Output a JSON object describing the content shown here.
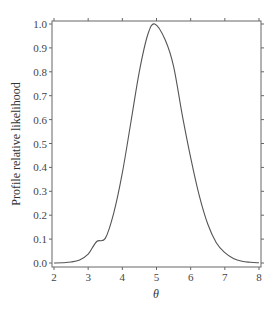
{
  "chart_data": {
    "type": "line",
    "title": "",
    "xlabel": "θ",
    "ylabel": "Profile relative likelihood",
    "xlim": [
      2,
      8
    ],
    "ylim": [
      0.0,
      1.0
    ],
    "xticks": [
      "2",
      "3",
      "4",
      "5",
      "6",
      "7",
      "8"
    ],
    "yticks": [
      "0.0",
      "0.1",
      "0.2",
      "0.3",
      "0.4",
      "0.5",
      "0.6",
      "0.7",
      "0.8",
      "0.9",
      "1.0"
    ],
    "grid": false,
    "legend": null,
    "series": [
      {
        "name": "profile relative likelihood",
        "color": "#555555",
        "x": [
          2.0,
          2.25,
          2.5,
          2.75,
          3.0,
          3.25,
          3.5,
          3.75,
          4.0,
          4.25,
          4.5,
          4.75,
          4.95,
          5.25,
          5.5,
          5.75,
          6.0,
          6.25,
          6.5,
          6.75,
          7.0,
          7.25,
          7.5,
          7.75,
          8.0
        ],
        "y": [
          0.0,
          0.001,
          0.004,
          0.013,
          0.037,
          0.09,
          0.103,
          0.21,
          0.377,
          0.589,
          0.803,
          0.958,
          1.0,
          0.935,
          0.823,
          0.622,
          0.441,
          0.283,
          0.163,
          0.085,
          0.043,
          0.019,
          0.007,
          0.003,
          0.001
        ]
      }
    ]
  }
}
